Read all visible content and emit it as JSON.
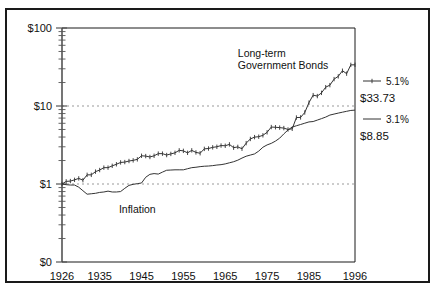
{
  "figure": {
    "background_color": "#ffffff",
    "frame_color": "#1a1a1a",
    "plot_line_color": "#333333",
    "grid_color": "#999999"
  },
  "chart_data": {
    "type": "line",
    "title": "",
    "subtitle": "",
    "xlabel": "",
    "ylabel": "",
    "scale": "log",
    "grid": "dotted-horizontal",
    "legend_position": "right",
    "xlim": [
      1926,
      1996
    ],
    "ylim": [
      0.1,
      100
    ],
    "x_tick_labels": [
      "1926",
      "1935",
      "1945",
      "1955",
      "1965",
      "1975",
      "1985",
      "1996"
    ],
    "x_tick_values": [
      1926,
      1935,
      1945,
      1955,
      1965,
      1975,
      1985,
      1996
    ],
    "y_tick_labels": [
      "$100",
      "$10",
      "$1",
      "$0"
    ],
    "y_tick_values": [
      100,
      10,
      1,
      0.1
    ],
    "gridline_values": [
      10,
      1
    ],
    "annotations": [
      {
        "text": "Long-term",
        "x": 1968,
        "y": 42
      },
      {
        "text": "Government Bonds",
        "x": 1968,
        "y": 30
      },
      {
        "text": "Inflation",
        "x": 1944,
        "y": 0.42
      }
    ],
    "series": [
      {
        "name": "Long-term Government Bonds",
        "legend_label": "5.1%",
        "end_value_label": "$33.73",
        "marker": "tick",
        "style": "solid-with-markers",
        "x": [
          1926,
          1927,
          1928,
          1929,
          1930,
          1931,
          1932,
          1933,
          1934,
          1935,
          1936,
          1937,
          1938,
          1939,
          1940,
          1941,
          1942,
          1943,
          1944,
          1945,
          1946,
          1947,
          1948,
          1949,
          1950,
          1951,
          1952,
          1953,
          1954,
          1955,
          1956,
          1957,
          1958,
          1959,
          1960,
          1961,
          1962,
          1963,
          1964,
          1965,
          1966,
          1967,
          1968,
          1969,
          1970,
          1971,
          1972,
          1973,
          1974,
          1975,
          1976,
          1977,
          1978,
          1979,
          1980,
          1981,
          1982,
          1983,
          1984,
          1985,
          1986,
          1987,
          1988,
          1989,
          1990,
          1991,
          1992,
          1993,
          1994,
          1995,
          1996
        ],
        "values": [
          1.0,
          1.08,
          1.09,
          1.13,
          1.18,
          1.12,
          1.31,
          1.31,
          1.44,
          1.51,
          1.62,
          1.62,
          1.71,
          1.79,
          1.89,
          1.91,
          1.97,
          2.01,
          2.07,
          2.3,
          2.28,
          2.22,
          2.3,
          2.45,
          2.45,
          2.35,
          2.43,
          2.51,
          2.7,
          2.66,
          2.51,
          2.7,
          2.54,
          2.48,
          2.82,
          2.85,
          2.95,
          3.0,
          3.11,
          3.09,
          3.22,
          2.92,
          2.99,
          2.83,
          3.34,
          3.78,
          3.99,
          4.04,
          4.21,
          4.6,
          5.37,
          5.34,
          5.28,
          5.21,
          5.0,
          5.1,
          7.11,
          7.14,
          8.26,
          11.04,
          13.78,
          13.4,
          14.74,
          17.42,
          18.52,
          22.12,
          24.0,
          28.32,
          25.97,
          33.67,
          33.73
        ]
      },
      {
        "name": "Inflation",
        "legend_label": "3.1%",
        "end_value_label": "$8.85",
        "marker": "none",
        "style": "solid",
        "x": [
          1926,
          1927,
          1928,
          1929,
          1930,
          1931,
          1932,
          1933,
          1934,
          1935,
          1936,
          1937,
          1938,
          1939,
          1940,
          1941,
          1942,
          1943,
          1944,
          1945,
          1946,
          1947,
          1948,
          1949,
          1950,
          1951,
          1952,
          1953,
          1954,
          1955,
          1956,
          1957,
          1958,
          1959,
          1960,
          1961,
          1962,
          1963,
          1964,
          1965,
          1966,
          1967,
          1968,
          1969,
          1970,
          1971,
          1972,
          1973,
          1974,
          1975,
          1976,
          1977,
          1978,
          1979,
          1980,
          1981,
          1982,
          1983,
          1984,
          1985,
          1986,
          1987,
          1988,
          1989,
          1990,
          1991,
          1992,
          1993,
          1994,
          1995,
          1996
        ],
        "values": [
          1.0,
          0.98,
          0.97,
          0.97,
          0.91,
          0.82,
          0.74,
          0.75,
          0.76,
          0.78,
          0.79,
          0.81,
          0.79,
          0.79,
          0.8,
          0.88,
          0.96,
          0.99,
          1.01,
          1.03,
          1.22,
          1.33,
          1.36,
          1.34,
          1.42,
          1.5,
          1.51,
          1.52,
          1.52,
          1.52,
          1.57,
          1.62,
          1.64,
          1.67,
          1.69,
          1.7,
          1.72,
          1.75,
          1.77,
          1.81,
          1.87,
          1.93,
          2.02,
          2.15,
          2.27,
          2.35,
          2.43,
          2.64,
          2.96,
          3.17,
          3.32,
          3.55,
          3.87,
          4.39,
          4.93,
          5.37,
          5.58,
          5.79,
          6.02,
          6.25,
          6.32,
          6.6,
          6.89,
          7.21,
          7.65,
          7.88,
          8.11,
          8.33,
          8.55,
          8.77,
          8.85
        ]
      }
    ]
  },
  "legend": {
    "entries": [
      {
        "swatch": "line-with-tick",
        "percent": "5.1%",
        "amount": "$33.73"
      },
      {
        "swatch": "line-plain",
        "percent": "3.1%",
        "amount": "$8.85"
      }
    ]
  }
}
